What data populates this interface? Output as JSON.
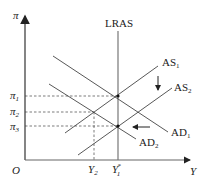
{
  "diagram": {
    "type": "AD-AS macroeconomic model",
    "axes": {
      "y_label": "π",
      "x_label": "Y",
      "origin_label": "O"
    },
    "y_ticks": [
      {
        "base": "π",
        "sub": "1",
        "y": 96
      },
      {
        "base": "π",
        "sub": "2",
        "y": 112
      },
      {
        "base": "π",
        "sub": "3",
        "y": 126
      }
    ],
    "x_ticks": [
      {
        "base": "Y",
        "sub": "2",
        "x": 94
      },
      {
        "base": "Y",
        "sub": "1",
        "sup": "*",
        "x": 118
      }
    ],
    "curves": {
      "lras": {
        "label": "LRAS"
      },
      "as1": {
        "base": "AS",
        "sub": "1"
      },
      "as2": {
        "base": "AS",
        "sub": "2"
      },
      "ad1": {
        "base": "AD",
        "sub": "1"
      },
      "ad2": {
        "base": "AD",
        "sub": "2"
      }
    },
    "arrows": {
      "as_shift": "down",
      "ad_shift": "left"
    },
    "colors": {
      "line": "#333333",
      "axis": "#555555",
      "dashed": "#444444"
    }
  }
}
